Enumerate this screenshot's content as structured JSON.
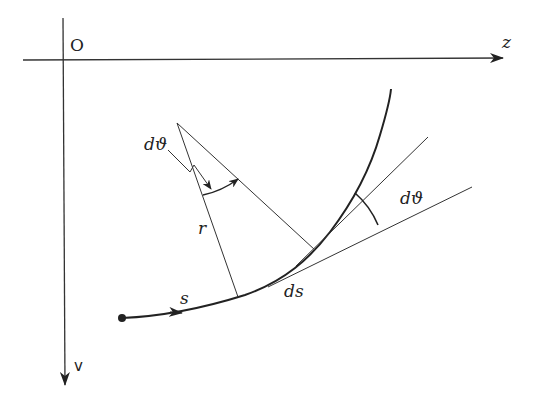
{
  "diagram": {
    "title": "",
    "labels": {
      "origin": "O",
      "horizontal_axis": "z",
      "vertical_axis": "v",
      "arc_length": "s",
      "arc_element": "ds",
      "radius": "r",
      "angle_at_center": "dϑ",
      "angle_between_tangents": "dϑ"
    },
    "colors": {
      "stroke": "#222222",
      "thin_stroke": "#333333",
      "background": "#ffffff"
    },
    "elements": [
      "horizontal axis z with arrow",
      "vertical axis v with arrow",
      "curved trajectory s starting at a dot, with direction arrow",
      "two radii r from center of curvature to curve",
      "two tangent lines at the ends of ds",
      "angle dϑ at center of curvature",
      "angle dϑ between the tangents"
    ]
  }
}
